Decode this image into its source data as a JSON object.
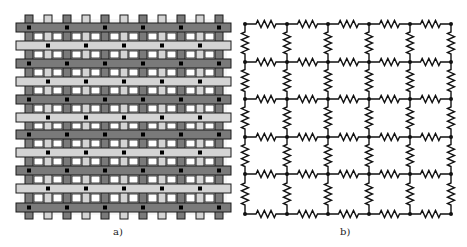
{
  "figure": {
    "panels": [
      {
        "id": "a",
        "label": "a)",
        "description": "Woven fabric lattice",
        "bars": {
          "x_left": 16,
          "x_right": 231,
          "height": 9,
          "rows": [
            {
              "y": 23,
              "shade": "dark"
            },
            {
              "y": 41,
              "shade": "light"
            },
            {
              "y": 59,
              "shade": "dark"
            },
            {
              "y": 77,
              "shade": "light"
            },
            {
              "y": 95,
              "shade": "dark"
            },
            {
              "y": 113,
              "shade": "light"
            },
            {
              "y": 130,
              "shade": "dark"
            },
            {
              "y": 148,
              "shade": "light"
            },
            {
              "y": 166,
              "shade": "dark"
            },
            {
              "y": 184,
              "shade": "light"
            },
            {
              "y": 203,
              "shade": "dark"
            }
          ]
        },
        "strips": {
          "y_top": 15,
          "y_bottom": 219,
          "width": 8,
          "cols": [
            {
              "x": 25,
              "shade": "dark"
            },
            {
              "x": 44,
              "shade": "light"
            },
            {
              "x": 63,
              "shade": "dark"
            },
            {
              "x": 82,
              "shade": "light"
            },
            {
              "x": 101,
              "shade": "dark"
            },
            {
              "x": 120,
              "shade": "light"
            },
            {
              "x": 139,
              "shade": "dark"
            },
            {
              "x": 158,
              "shade": "light"
            },
            {
              "x": 177,
              "shade": "dark"
            },
            {
              "x": 196,
              "shade": "light"
            },
            {
              "x": 215,
              "shade": "dark"
            }
          ]
        },
        "colors": {
          "dark": "#7a7a7a",
          "light": "#d4d4d4",
          "hole": "#f6f6f6",
          "outline": "#1a1a1a",
          "dot": "#000000"
        }
      },
      {
        "id": "b",
        "label": "b)",
        "description": "Resistor network grid",
        "nodes_x": [
          245,
          287,
          328,
          369,
          410,
          451
        ],
        "nodes_y": [
          24,
          62,
          99,
          137,
          174,
          214
        ],
        "colors": {
          "wire": "#111111"
        }
      }
    ]
  }
}
